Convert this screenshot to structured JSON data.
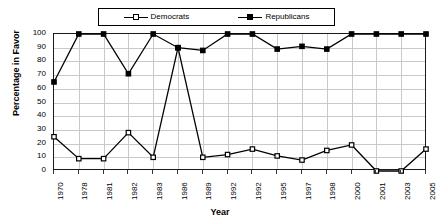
{
  "chart_data": {
    "type": "line",
    "title": "",
    "xlabel": "Year",
    "ylabel": "Percentage in Favor",
    "ylim": [
      0,
      100
    ],
    "ytick_labels": [
      "100",
      "90",
      "80",
      "70",
      "60",
      "50",
      "40",
      "30",
      "20",
      "10",
      "0"
    ],
    "ytick_values": [
      100,
      90,
      80,
      70,
      60,
      50,
      40,
      30,
      20,
      10,
      0
    ],
    "grid": true,
    "legend_position": "top-center",
    "categories": [
      "1970",
      "1978",
      "1981",
      "1982",
      "1983",
      "1986",
      "1989",
      "1992",
      "1992",
      "1995",
      "1997",
      "1998",
      "2000",
      "2001",
      "2003",
      "2005"
    ],
    "series": [
      {
        "name": "Democrats",
        "marker": "open-square",
        "color": "#000000",
        "values": [
          25,
          9,
          9,
          28,
          10,
          90,
          10,
          12,
          16,
          11,
          8,
          15,
          19,
          0,
          0,
          16
        ]
      },
      {
        "name": "Republicans",
        "marker": "filled-square",
        "color": "#000000",
        "values": [
          65,
          100,
          100,
          71,
          100,
          90,
          88,
          100,
          100,
          89,
          91,
          89,
          100,
          100,
          100,
          100
        ]
      }
    ]
  },
  "legend": {
    "items": [
      {
        "label": "Democrats",
        "marker": "open-square"
      },
      {
        "label": "Republicans",
        "marker": "filled-square"
      }
    ]
  },
  "axes": {
    "x_title": "Year",
    "y_title": "Percentage in Favor"
  }
}
